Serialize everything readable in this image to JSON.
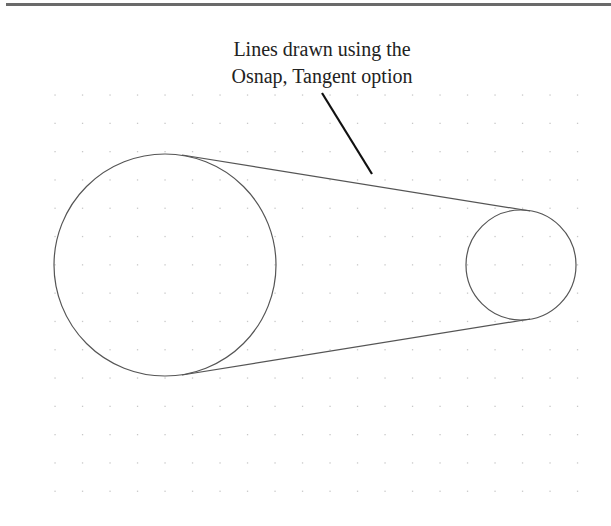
{
  "figure": {
    "caption_lines": [
      "Lines drawn using the",
      "Osnap, Tangent option"
    ],
    "grid": {
      "x_start": 55,
      "x_step": 27.5,
      "columns": 20,
      "y_start": 95,
      "y_step": 28.3,
      "rows": 15,
      "dot_color": "#c8c8c8"
    },
    "large_circle": {
      "cx": 165,
      "cy": 265,
      "r": 111
    },
    "small_circle": {
      "cx": 521,
      "cy": 265,
      "r": 55
    },
    "tangent_lines": [
      {
        "x1": 182,
        "y1": 155,
        "x2": 530,
        "y2": 211
      },
      {
        "x1": 182,
        "y1": 375,
        "x2": 530,
        "y2": 319
      }
    ],
    "leader": {
      "x1": 322,
      "y1": 93,
      "x2": 372,
      "y2": 174
    },
    "stroke_color": "#555555",
    "leader_color": "#111111"
  }
}
